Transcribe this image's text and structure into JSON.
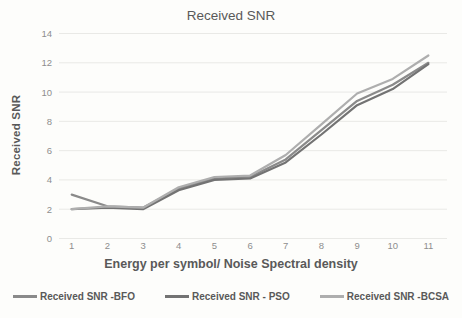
{
  "chart_data": {
    "type": "line",
    "title": "Received SNR",
    "xlabel": "Energy per symbol/ Noise Spectral density",
    "ylabel": "Received SNR",
    "categories": [
      1,
      2,
      3,
      4,
      5,
      6,
      7,
      8,
      9,
      10,
      11
    ],
    "ylim": [
      0,
      14
    ],
    "ytick_step": 2,
    "grid": "horizontal",
    "legend_position": "bottom",
    "axis_text_color": "#8e8e8e",
    "label_text_color": "#595959",
    "gridline_color": "#e9e9e6",
    "series": [
      {
        "name": "Received SNR -BFO",
        "color": "#8a8a8a",
        "values": [
          3.0,
          2.2,
          2.1,
          3.4,
          4.1,
          4.2,
          5.4,
          7.4,
          9.4,
          10.5,
          12.0
        ]
      },
      {
        "name": "Received SNR - PSO",
        "color": "#737373",
        "values": [
          2.0,
          2.1,
          2.0,
          3.3,
          4.0,
          4.1,
          5.2,
          7.1,
          9.1,
          10.2,
          11.9
        ]
      },
      {
        "name": "Received SNR -BCSA",
        "color": "#aeaeae",
        "values": [
          2.0,
          2.2,
          2.1,
          3.5,
          4.2,
          4.3,
          5.7,
          7.8,
          9.9,
          10.9,
          12.5
        ]
      }
    ]
  }
}
